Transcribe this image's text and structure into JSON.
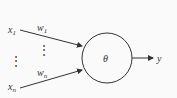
{
  "diagram": {
    "type": "perceptron-neuron",
    "inputs": [
      {
        "label": "x",
        "subscript": "1",
        "weight": "w",
        "weight_subscript": "1"
      },
      {
        "label": "x",
        "subscript": "n",
        "weight": "w",
        "weight_subscript": "n"
      }
    ],
    "ellipsis": "⋮",
    "node_label": "θ",
    "output_label": "y",
    "colors": {
      "line": "#333333",
      "background": "#fafafa"
    }
  }
}
